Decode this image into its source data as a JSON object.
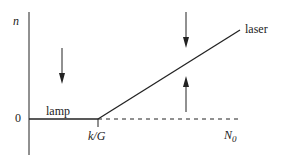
{
  "diagram": {
    "y_axis_label": "n",
    "zero_label": "0",
    "threshold_label": "k/G",
    "x_axis_end_label": "N",
    "x_axis_end_sub": "0",
    "lamp_label": "lamp",
    "laser_label": "laser",
    "colors": {
      "line": "#222222"
    }
  }
}
